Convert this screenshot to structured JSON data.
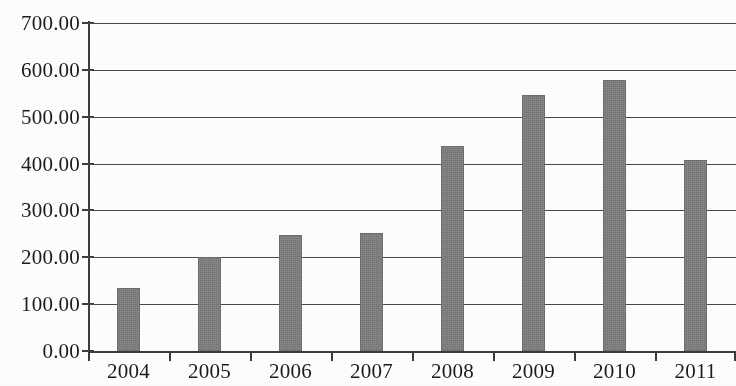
{
  "chart_data": {
    "type": "bar",
    "title": "",
    "subtitle": "",
    "xlabel": "",
    "ylabel": "",
    "categories": [
      "2004",
      "2005",
      "2006",
      "2007",
      "2008",
      "2009",
      "2010",
      "2011"
    ],
    "values": [
      134,
      200,
      247,
      252,
      437,
      546,
      578,
      407
    ],
    "series": [
      {
        "name": "",
        "values": [
          134,
          200,
          247,
          252,
          437,
          546,
          578,
          407
        ]
      }
    ],
    "ylim": [
      0,
      700
    ],
    "ytick_step": 100,
    "ytick_labels": [
      "0.00",
      "100.00",
      "200.00",
      "300.00",
      "400.00",
      "500.00",
      "600.00",
      "700.00"
    ],
    "ytick_values": [
      0,
      100,
      200,
      300,
      400,
      500,
      600,
      700
    ],
    "xtick_labels": [
      "2004",
      "2005",
      "2006",
      "2007",
      "2008",
      "2009",
      "2010",
      "2011"
    ],
    "grid": true,
    "grid_axis": "y",
    "legend": false,
    "legend_position": "none",
    "annotations": [],
    "bar_color": "#7e7e7e",
    "axis_color": "#3c3c3c",
    "grid_color": "#4a4a4a",
    "text_color": "#1c1c1c",
    "background_color": "#fdfdfd"
  }
}
